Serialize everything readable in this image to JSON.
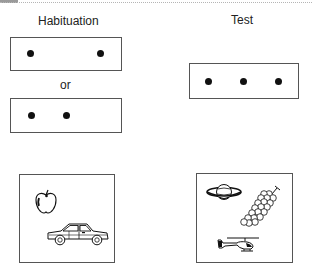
{
  "figure": {
    "columns": {
      "left_title": "Habituation",
      "right_title": "Test"
    },
    "separator_text": "or",
    "habituation_dot_displays": [
      {
        "dot_count": 2,
        "arrangement": "wide-spaced"
      },
      {
        "dot_count": 2,
        "arrangement": "close-spaced"
      }
    ],
    "test_dot_display": {
      "dot_count": 3,
      "arrangement": "evenly-spaced"
    },
    "habituation_picture_display": {
      "item_count": 2,
      "items": [
        "apple",
        "car"
      ]
    },
    "test_picture_display": {
      "item_count": 3,
      "items": [
        "planet",
        "grapes",
        "helicopter"
      ]
    },
    "colors": {
      "ink": "#111111",
      "border": "#555555",
      "background": "#ffffff"
    }
  }
}
